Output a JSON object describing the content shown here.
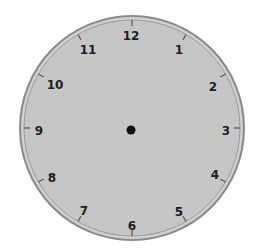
{
  "clock": {
    "numerals": [
      "12",
      "1",
      "2",
      "3",
      "4",
      "5",
      "6",
      "7",
      "8",
      "9",
      "10",
      "11"
    ],
    "hands": "none",
    "colors": {
      "face": "#c4c4c4",
      "rim": "#8a8a8a",
      "numerals": "#1e1e1e",
      "center_dot": "#111111"
    }
  }
}
